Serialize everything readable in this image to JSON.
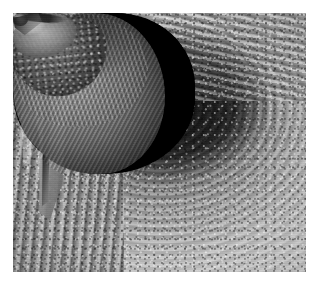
{
  "page": {
    "kind": "photograph",
    "background_color": "#ffffff",
    "width": 319,
    "height": 291
  },
  "photo": {
    "name": "bat-roosting-in-tree-hollow",
    "description": "Black and white photograph of a bat clinging inside a hollow cavity of a tree trunk",
    "color_mode": "grayscale",
    "frame": {
      "left": 13,
      "top": 13,
      "width": 293,
      "height": 259,
      "border_color": "#ffffff"
    },
    "palette": {
      "cavity_black": "#050505",
      "bark_shadow": "#4a4a4a",
      "bark_midtone": "#8c8c8c",
      "bark_highlight": "#d9d9d9",
      "fur_midtone": "#8f8f8f",
      "fur_highlight": "#ededed",
      "paper_white": "#ffffff"
    },
    "subjects": [
      {
        "label": "tree-bark",
        "note": "weathered wood grain with concentric swirls at left and vertical striations at right"
      },
      {
        "label": "tree-hollow",
        "note": "dark cavity opening in the upper-centre of the trunk"
      },
      {
        "label": "bat",
        "note": "big brown bat hanging head-down, folded wing at left, face turned to the right"
      },
      {
        "label": "bat-ear",
        "note": "large ridged ear with tragus"
      },
      {
        "label": "bat-eye",
        "note": "small dark eye with catchlight"
      },
      {
        "label": "bat-muzzle",
        "note": "pale highlighted snout and mouth"
      },
      {
        "label": "bat-wing",
        "note": "long folded forearm and membrane running down the left side"
      }
    ]
  }
}
